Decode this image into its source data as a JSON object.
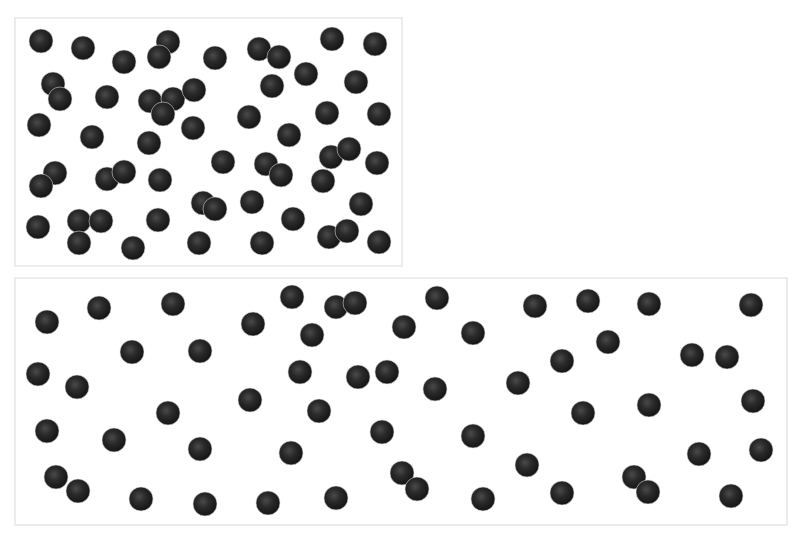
{
  "colors": {
    "background": "#ffffff",
    "panel_border": "#ececec",
    "ball_dark": "#151515",
    "ball_mid": "#2a2a2a",
    "ball_highlight": "#4a4a4a"
  },
  "ball_radius": 12,
  "panels": [
    {
      "name": "top-panel",
      "rect": {
        "x": 15,
        "y": 18,
        "w": 387,
        "h": 248
      },
      "ball_count": 56,
      "balls": [
        [
          41,
          41
        ],
        [
          83,
          48
        ],
        [
          124,
          62
        ],
        [
          168,
          42
        ],
        [
          159,
          57
        ],
        [
          215,
          58
        ],
        [
          259,
          49
        ],
        [
          279,
          57
        ],
        [
          332,
          39
        ],
        [
          375,
          44
        ],
        [
          53,
          84
        ],
        [
          60,
          99
        ],
        [
          107,
          97
        ],
        [
          150,
          101
        ],
        [
          173,
          99
        ],
        [
          163,
          114
        ],
        [
          194,
          90
        ],
        [
          272,
          86
        ],
        [
          306,
          74
        ],
        [
          356,
          82
        ],
        [
          39,
          125
        ],
        [
          92,
          137
        ],
        [
          149,
          143
        ],
        [
          193,
          128
        ],
        [
          249,
          117
        ],
        [
          289,
          135
        ],
        [
          327,
          113
        ],
        [
          379,
          114
        ],
        [
          55,
          173
        ],
        [
          41,
          186
        ],
        [
          107,
          179
        ],
        [
          124,
          172
        ],
        [
          160,
          180
        ],
        [
          223,
          162
        ],
        [
          266,
          164
        ],
        [
          281,
          175
        ],
        [
          331,
          157
        ],
        [
          349,
          149
        ],
        [
          323,
          181
        ],
        [
          377,
          163
        ],
        [
          203,
          203
        ],
        [
          215,
          209
        ],
        [
          252,
          202
        ],
        [
          361,
          204
        ],
        [
          38,
          227
        ],
        [
          79,
          221
        ],
        [
          101,
          221
        ],
        [
          79,
          243
        ],
        [
          133,
          248
        ],
        [
          158,
          220
        ],
        [
          199,
          243
        ],
        [
          262,
          243
        ],
        [
          293,
          219
        ],
        [
          329,
          237
        ],
        [
          347,
          231
        ],
        [
          379,
          242
        ]
      ]
    },
    {
      "name": "bottom-panel",
      "rect": {
        "x": 15,
        "y": 278,
        "w": 772,
        "h": 247
      },
      "ball_count": 57,
      "balls": [
        [
          47,
          322
        ],
        [
          99,
          308
        ],
        [
          173,
          304
        ],
        [
          253,
          324
        ],
        [
          292,
          297
        ],
        [
          336,
          307
        ],
        [
          355,
          303
        ],
        [
          312,
          335
        ],
        [
          132,
          352
        ],
        [
          200,
          351
        ],
        [
          38,
          374
        ],
        [
          77,
          387
        ],
        [
          300,
          372
        ],
        [
          358,
          377
        ],
        [
          387,
          372
        ],
        [
          250,
          400
        ],
        [
          168,
          413
        ],
        [
          319,
          411
        ],
        [
          47,
          431
        ],
        [
          114,
          440
        ],
        [
          200,
          449
        ],
        [
          291,
          453
        ],
        [
          382,
          432
        ],
        [
          56,
          477
        ],
        [
          78,
          491
        ],
        [
          141,
          499
        ],
        [
          205,
          504
        ],
        [
          268,
          503
        ],
        [
          336,
          498
        ],
        [
          437,
          298
        ],
        [
          404,
          327
        ],
        [
          473,
          333
        ],
        [
          535,
          306
        ],
        [
          588,
          301
        ],
        [
          649,
          304
        ],
        [
          751,
          305
        ],
        [
          562,
          361
        ],
        [
          608,
          342
        ],
        [
          692,
          355
        ],
        [
          727,
          357
        ],
        [
          518,
          383
        ],
        [
          435,
          389
        ],
        [
          753,
          401
        ],
        [
          583,
          413
        ],
        [
          649,
          405
        ],
        [
          473,
          436
        ],
        [
          699,
          454
        ],
        [
          761,
          450
        ],
        [
          527,
          465
        ],
        [
          402,
          473
        ],
        [
          417,
          489
        ],
        [
          483,
          499
        ],
        [
          562,
          493
        ],
        [
          634,
          477
        ],
        [
          648,
          492
        ],
        [
          731,
          496
        ]
      ]
    }
  ]
}
